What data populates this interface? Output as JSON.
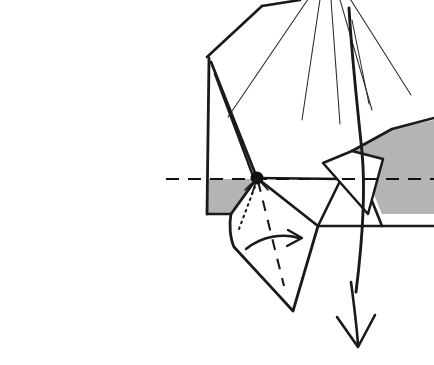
{
  "figure": {
    "title": "Origami folding step diagram",
    "caption": "",
    "kind": "line-drawing",
    "width": 434,
    "height": 365,
    "background_color": "#ffffff",
    "ink_color": "#1a1a1a",
    "shade_color": "#b4b4b4"
  },
  "geometry": {
    "pivot_point": {
      "x": 257,
      "y": 178,
      "radius": 6.5
    },
    "rotation_axis": {
      "name": "horizontal-rotation-axis",
      "style": "dashed",
      "x1": 166,
      "y1": 179,
      "x2": 434,
      "y2": 179
    },
    "shaded_panels": [
      {
        "name": "left-shaded-panel",
        "points": "211,68 207,213 240,213 253,176 233,96"
      },
      {
        "name": "right-shaded-panel",
        "points": "392,129 352,151 362,166 382,214 434,214 434,118"
      }
    ],
    "paper_outline": {
      "name": "main-paper-body",
      "points": "207,57 262,6 302,0 434,0 434,214 207,214"
    },
    "radiating_creases": [
      {
        "name": "crease-1",
        "x1": 317,
        "y1": -14,
        "x2": 228,
        "y2": 117
      },
      {
        "name": "crease-2",
        "x1": 322,
        "y1": -14,
        "x2": 302,
        "y2": 120
      },
      {
        "name": "crease-3",
        "x1": 330,
        "y1": -14,
        "x2": 340,
        "y2": 124
      },
      {
        "name": "crease-4",
        "x1": 336,
        "y1": -14,
        "x2": 372,
        "y2": 110
      },
      {
        "name": "crease-5",
        "x1": 342,
        "y1": -14,
        "x2": 411,
        "y2": 95
      },
      {
        "name": "crease-6",
        "x1": 352,
        "y1": 20,
        "x2": 369,
        "y2": 104
      }
    ],
    "long_curve": {
      "name": "sweeping-fold-curve",
      "path": "M 349,8 C 352,60 358,110 362,150 C 366,192 362,250 358,300"
    },
    "inner_quad": {
      "name": "inner-white-quadrilateral",
      "points": "352,151 325,162 368,212 382,160"
    },
    "lower_flap": {
      "name": "rotated-lower-flap",
      "points": "257,178 318,226 293,311 237,253 232,216"
    },
    "flap_creases": [
      {
        "name": "flap-hidden-crease",
        "style": "dotted",
        "path": "M 257,180 L 240,228"
      },
      {
        "name": "flap-valley-crease",
        "style": "dashed",
        "path": "M 257,180 L 283,284"
      }
    ],
    "lower_right_edges": [
      {
        "name": "panel-edge-a",
        "path": "M 318,226 L 382,226 L 434,226"
      },
      {
        "name": "panel-edge-b",
        "path": "M 341,179 L 318,226"
      },
      {
        "name": "panel-edge-c",
        "path": "M 382,214 L 382,226"
      }
    ],
    "rotation_arrow": {
      "name": "curved-rotation-arrow",
      "path": "M 247,248 C 262,236 284,234 298,238",
      "head": "M 288,231 L 301,238 L 287,245"
    },
    "direction_arrow": {
      "name": "downward-direction-arrow",
      "shaft": "M 352,283 C 355,305 357,326 358,345",
      "head": "M 337,318 L 358,347 L 374,316"
    }
  },
  "annotations": {
    "pivot_label": "",
    "axis_label": "",
    "arrow_label": ""
  }
}
